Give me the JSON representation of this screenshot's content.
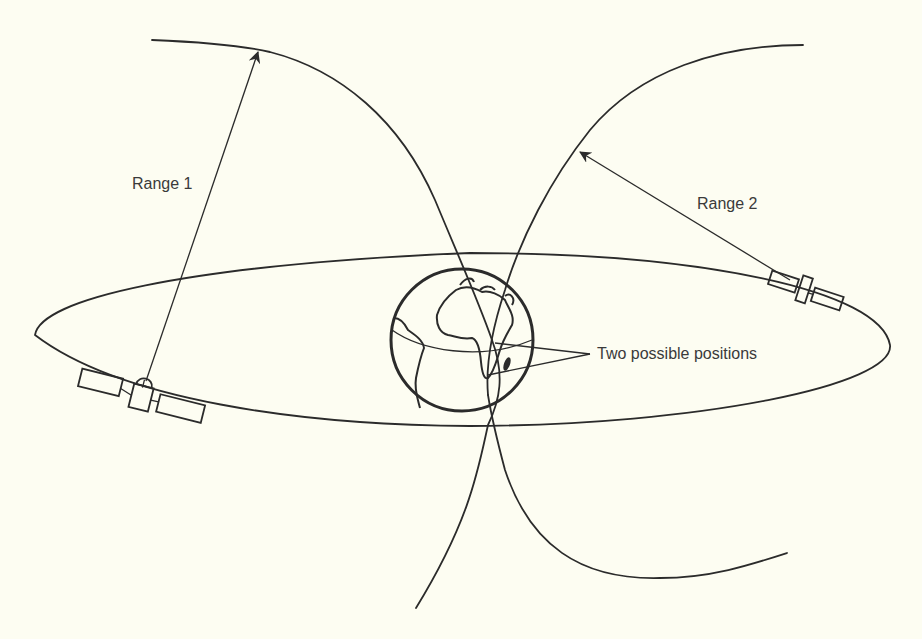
{
  "diagram": {
    "type": "satellite-ranging-illustration",
    "labels": {
      "range1": "Range 1",
      "range2": "Range 2",
      "positions": "Two possible positions"
    },
    "elements": [
      {
        "id": "orbit",
        "shape": "ellipse",
        "description": "Satellite orbit around Earth"
      },
      {
        "id": "earth",
        "shape": "globe",
        "description": "Earth showing Africa and South America"
      },
      {
        "id": "satellite-1",
        "description": "Satellite on left of orbit"
      },
      {
        "id": "satellite-2",
        "description": "Satellite on right of orbit"
      },
      {
        "id": "range-sphere-1",
        "description": "Range 1 sphere arc from satellite 1"
      },
      {
        "id": "range-sphere-2",
        "description": "Range 2 sphere arc from satellite 2"
      }
    ],
    "colors": {
      "background": "#fdfdf2",
      "ink": "#2b2b2b",
      "text": "#3a3a3a"
    }
  }
}
